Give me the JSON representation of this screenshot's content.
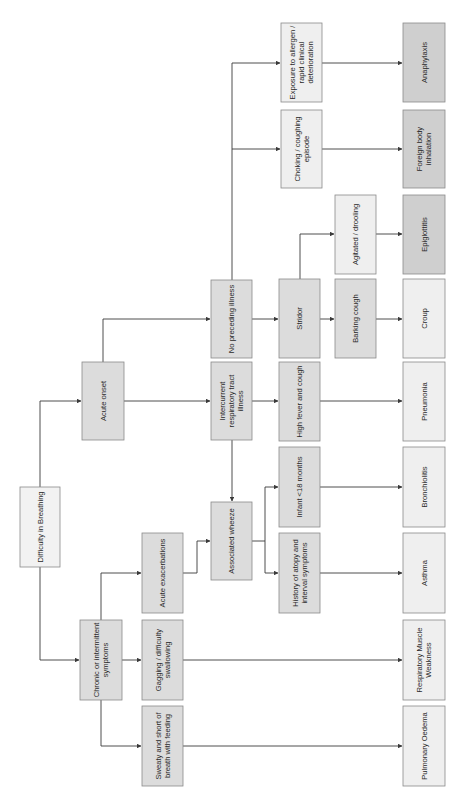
{
  "diagram": {
    "title": "Difficulty in Breathing",
    "orientation": "rotated-90-ccw",
    "colors": {
      "root": "#f2f2f2",
      "decision": "#dcdcdc",
      "outcome_light": "#efefef",
      "outcome_dark": "#cfcfcf",
      "edge": "#3a3a3a",
      "border": "#8a8a8a"
    },
    "nodes": {
      "root": {
        "label_lines": [
          "Difficulty in Breathing"
        ]
      },
      "chronic": {
        "label_lines": [
          "Chronic or intermittent",
          "symptoms"
        ]
      },
      "acute_onset": {
        "label_lines": [
          "Acute onset"
        ]
      },
      "sweaty": {
        "label_lines": [
          "Sweaty and short of",
          "breath with feeding"
        ]
      },
      "gagging": {
        "label_lines": [
          "Gagging / difficulty",
          "swallowing"
        ]
      },
      "acute_exac": {
        "label_lines": [
          "Acute exacerbations"
        ]
      },
      "assoc_wheeze": {
        "label_lines": [
          "Associated wheeze"
        ]
      },
      "intercurrent": {
        "label_lines": [
          "Intercurrent",
          "respiratory tract",
          "illness"
        ]
      },
      "no_preceding": {
        "label_lines": [
          "No preceding illness"
        ]
      },
      "history_atopy": {
        "label_lines": [
          "History of atopy and",
          "interval symptoms"
        ]
      },
      "infant": {
        "label_lines": [
          "Infant <18 months"
        ]
      },
      "high_fever": {
        "label_lines": [
          "High fever and cough"
        ]
      },
      "stridor": {
        "label_lines": [
          "Stridor"
        ]
      },
      "barking": {
        "label_lines": [
          "Barking cough"
        ]
      },
      "agitated": {
        "label_lines": [
          "Agitated / drooling"
        ]
      },
      "choking": {
        "label_lines": [
          "Choking / coughing",
          "episode"
        ]
      },
      "exposure": {
        "label_lines": [
          "Exposure to allergen /",
          "rapid clinical",
          "deterioration"
        ]
      },
      "pulm_oedema": {
        "label_lines": [
          "Pulmonary Oedema"
        ]
      },
      "resp_muscle": {
        "label_lines": [
          "Respiratory Muscle",
          "Weakness"
        ]
      },
      "asthma": {
        "label_lines": [
          "Asthma"
        ]
      },
      "bronchiolitis": {
        "label_lines": [
          "Bronchiolitis"
        ]
      },
      "pneumonia": {
        "label_lines": [
          "Pneumonia"
        ]
      },
      "croup": {
        "label_lines": [
          "Croup"
        ]
      },
      "epiglottitis": {
        "label_lines": [
          "Epiglottitis"
        ]
      },
      "foreign_body": {
        "label_lines": [
          "Foreign body",
          "inhalation"
        ]
      },
      "anaphylaxis": {
        "label_lines": [
          "Anaphylaxis"
        ]
      }
    },
    "edges": [
      [
        "root",
        "chronic"
      ],
      [
        "root",
        "acute_onset"
      ],
      [
        "chronic",
        "sweaty"
      ],
      [
        "chronic",
        "gagging"
      ],
      [
        "chronic",
        "acute_exac"
      ],
      [
        "acute_onset",
        "intercurrent"
      ],
      [
        "acute_onset",
        "no_preceding"
      ],
      [
        "acute_onset",
        "exposure"
      ],
      [
        "acute_exac",
        "assoc_wheeze"
      ],
      [
        "intercurrent",
        "assoc_wheeze"
      ],
      [
        "assoc_wheeze",
        "history_atopy"
      ],
      [
        "assoc_wheeze",
        "infant"
      ],
      [
        "intercurrent",
        "high_fever"
      ],
      [
        "no_preceding",
        "stridor"
      ],
      [
        "no_preceding",
        "choking"
      ],
      [
        "stridor",
        "barking"
      ],
      [
        "stridor",
        "agitated"
      ],
      [
        "sweaty",
        "pulm_oedema"
      ],
      [
        "gagging",
        "resp_muscle"
      ],
      [
        "history_atopy",
        "asthma"
      ],
      [
        "infant",
        "bronchiolitis"
      ],
      [
        "high_fever",
        "pneumonia"
      ],
      [
        "barking",
        "croup"
      ],
      [
        "agitated",
        "epiglottitis"
      ],
      [
        "choking",
        "foreign_body"
      ],
      [
        "exposure",
        "anaphylaxis"
      ]
    ]
  }
}
